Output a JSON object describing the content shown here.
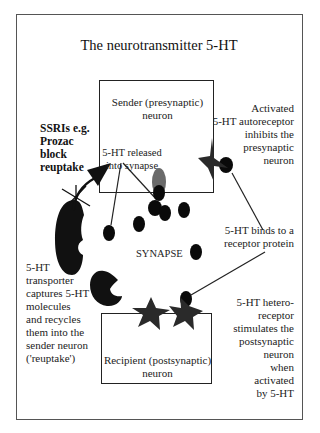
{
  "title": "The neurotransmitter 5-HT",
  "boxes": {
    "sender": {
      "line1": "Sender (presynaptic)",
      "line2": "neuron"
    },
    "recipient": {
      "line1": "Recipient (postsynaptic)",
      "line2": "neuron"
    }
  },
  "labels": {
    "ssri": [
      "SSRIs e.g.",
      "Prozac",
      "block",
      "reuptake"
    ],
    "released": [
      "5-HT released",
      "into synapse"
    ],
    "autoreceptor": [
      "Activated",
      "5-HT autoreceptor",
      "inhibits the",
      "presynaptic",
      "neuron"
    ],
    "binds": [
      "5-HT binds to a",
      "receptor protein"
    ],
    "synapse": "SYNAPSE",
    "transporter": [
      "5-HT",
      "transporter",
      "captures 5-HT",
      "molecules",
      "and recycles",
      "them into the",
      "sender neuron",
      "('reuptake')"
    ],
    "heteroreceptor": [
      "5-HT hetero-",
      "receptor",
      "stimulates the",
      "postsynaptic",
      "neuron",
      "when",
      "activated",
      "by 5-HT"
    ]
  },
  "colors": {
    "molecule": "#0a0a0a",
    "receptor": "#2a2a2a",
    "vesicle": "#6a6a6a",
    "line": "#222222"
  }
}
